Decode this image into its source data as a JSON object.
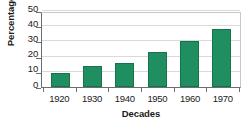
{
  "chart_data": {
    "type": "bar",
    "title": "",
    "subtitle": "",
    "categories": [
      "1920",
      "1930",
      "1940",
      "1950",
      "1960",
      "1970"
    ],
    "values": [
      9.5,
      13.5,
      15.5,
      23,
      30.5,
      38
    ],
    "xlabel": "Decades",
    "ylabel": "Percentage",
    "ylim": [
      0,
      50
    ],
    "yticks": [
      0,
      10,
      20,
      30,
      40,
      50
    ],
    "ytick_labels": [
      "0",
      "10",
      "20",
      "30",
      "40",
      "50"
    ],
    "grid": true,
    "grid_axis": "y",
    "legend": false,
    "legend_position": "none",
    "bar_color": "#1f8f62",
    "bar_edge_color": "#17734e",
    "gridline_color": "#d9d9d9",
    "axis_color": "#6d6d6d",
    "background_color": "#ffffff",
    "text_color": "#1a1a1a"
  }
}
